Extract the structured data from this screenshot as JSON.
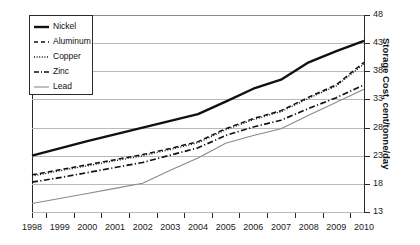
{
  "chart_data": {
    "type": "line",
    "title": "",
    "xlabel": "",
    "ylabel": "Storage Cost, cent/tonne/day",
    "x": [
      1998,
      1999,
      2000,
      2001,
      2002,
      2003,
      2004,
      2005,
      2006,
      2007,
      2008,
      2009,
      2010
    ],
    "categories": [
      "1998",
      "1999",
      "2000",
      "2001",
      "2002",
      "2003",
      "2004",
      "2005",
      "2006",
      "2007",
      "2008",
      "2009",
      "2010"
    ],
    "xlim": [
      1998,
      2010
    ],
    "ylim": [
      13,
      48
    ],
    "yticks": [
      13,
      18,
      23,
      28,
      33,
      38,
      43,
      48
    ],
    "ytick_labels": [
      "13",
      "18",
      "23",
      "28",
      "33",
      "38",
      "43",
      "48"
    ],
    "grid": true,
    "grid_axis": "y",
    "legend_position": "top-left",
    "series": [
      {
        "name": "Nickel",
        "style": "solid-thick",
        "color": "#111111",
        "values": [
          23.0,
          24.3,
          25.6,
          26.8,
          28.0,
          29.2,
          30.4,
          32.6,
          34.9,
          36.5,
          39.6,
          41.6,
          43.4
        ]
      },
      {
        "name": "Aluminum",
        "style": "dashed",
        "color": "#111111",
        "values": [
          19.6,
          20.5,
          21.4,
          22.3,
          23.2,
          24.3,
          25.5,
          27.8,
          29.6,
          31.0,
          33.4,
          35.6,
          39.6
        ]
      },
      {
        "name": "Copper",
        "style": "dotted",
        "color": "#111111",
        "values": [
          19.4,
          20.3,
          21.2,
          22.1,
          23.0,
          24.1,
          25.3,
          27.6,
          29.4,
          30.8,
          33.2,
          35.4,
          39.3
        ]
      },
      {
        "name": "Zinc",
        "style": "dash-dot",
        "color": "#111111",
        "values": [
          18.3,
          19.1,
          20.0,
          20.9,
          21.8,
          23.1,
          24.4,
          26.6,
          28.1,
          29.3,
          31.4,
          33.3,
          35.6
        ]
      },
      {
        "name": "Lead",
        "style": "solid-thin",
        "color": "#8a8a8a",
        "values": [
          14.5,
          15.4,
          16.3,
          17.2,
          18.1,
          20.4,
          22.6,
          25.2,
          26.6,
          27.8,
          30.2,
          32.5,
          34.8
        ]
      }
    ]
  },
  "legend": {
    "items": [
      {
        "label": "Nickel"
      },
      {
        "label": "Aluminum"
      },
      {
        "label": "Copper"
      },
      {
        "label": "Zinc"
      },
      {
        "label": "Lead"
      }
    ]
  }
}
